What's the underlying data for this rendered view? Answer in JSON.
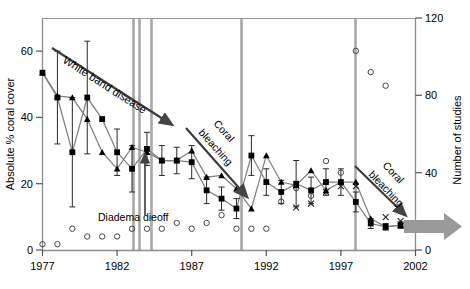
{
  "chart_data": {
    "type": "line",
    "title": "",
    "xlabel": "",
    "ylabel": "Absolute % coral cover",
    "ylabel_right": "Number of studies",
    "xlim": [
      1977,
      2002
    ],
    "ylim": [
      0,
      70
    ],
    "ylim_right": [
      0,
      120
    ],
    "xticks": [
      "1977",
      "1982",
      "1987",
      "1992",
      "1997",
      "2002"
    ],
    "xtick_values": [
      1977,
      1982,
      1987,
      1992,
      1997,
      2002
    ],
    "yticks_left": [
      "0",
      "20",
      "40",
      "60"
    ],
    "ytick_values_left": [
      0,
      20,
      40,
      60
    ],
    "yticks_right": [
      "0",
      "40",
      "80",
      "120"
    ],
    "ytick_values_right": [
      0,
      40,
      80,
      120
    ],
    "grid": false,
    "legend": "none",
    "series": [
      {
        "name": "mean-coral-cover-square",
        "marker": "filled-square",
        "x": [
          1977,
          1978,
          1979,
          1980,
          1981,
          1982,
          1983,
          1984,
          1985,
          1986,
          1987,
          1988,
          1989,
          1990,
          1991,
          1992,
          1993,
          1994,
          1995,
          1996,
          1997,
          1998,
          1999,
          2000,
          2001
        ],
        "values": [
          53.5,
          46.0,
          29.5,
          46.0,
          39.5,
          29.5,
          24.5,
          30.5,
          27.0,
          27.0,
          26.5,
          18.0,
          15.5,
          12.5,
          28.5,
          20.5,
          17.5,
          20.0,
          18.0,
          20.5,
          20.5,
          14.5,
          8.0,
          7.0,
          7.5
        ],
        "errors": [
          null,
          14.0,
          16.5,
          17.0,
          null,
          7.0,
          7.0,
          5.0,
          4.5,
          4.0,
          5.0,
          4.0,
          3.5,
          3.0,
          6.0,
          4.0,
          3.5,
          7.0,
          4.0,
          4.0,
          4.0,
          3.0,
          1.5,
          1.0,
          1.0
        ]
      },
      {
        "name": "median-coral-cover-triangle",
        "marker": "filled-triangle",
        "x": [
          1977,
          1978,
          1979,
          1980,
          1981,
          1982,
          1983,
          1984,
          1985,
          1986,
          1987,
          1988,
          1989,
          1990,
          1991,
          1992,
          1993,
          1994,
          1995,
          1996,
          1997,
          1998,
          1999,
          2000,
          2001
        ],
        "values": [
          53.5,
          46.5,
          46.0,
          39.5,
          29.5,
          24.5,
          31.0,
          29.5,
          27.0,
          27.0,
          30.0,
          22.0,
          22.5,
          18.5,
          12.5,
          28.5,
          20.5,
          19.5,
          24.0,
          18.0,
          20.5,
          20.5,
          9.5,
          7.0,
          7.5
        ]
      },
      {
        "name": "number-of-studies-open-circle",
        "marker": "open-circle",
        "x": [
          1977,
          1978,
          1979,
          1980,
          1981,
          1982,
          1983,
          1984,
          1985,
          1986,
          1987,
          1988,
          1989,
          1990,
          1991,
          1992,
          1993,
          1994,
          1995,
          1996,
          1997,
          1998,
          1999,
          2000
        ],
        "values": [
          3,
          3,
          11,
          7,
          7,
          7,
          11,
          11,
          11,
          14,
          11,
          14,
          18,
          11,
          11,
          11,
          25,
          32,
          28,
          46,
          40,
          103,
          92,
          85
        ]
      },
      {
        "name": "secondary-studies-cross",
        "marker": "cross",
        "x": [
          1994,
          1995,
          1996,
          1997,
          1998,
          2000,
          2001
        ],
        "values": [
          22,
          24,
          30,
          33,
          33,
          17,
          15
        ]
      }
    ],
    "event_lines": [
      {
        "label": "hurricane-allen",
        "year": 1983.0
      },
      {
        "label": "diadema-dieoff-line",
        "year": 1983.4
      },
      {
        "label": "diadema-dieoff-marker",
        "year": 1984.2
      },
      {
        "label": "bleaching-1990",
        "year": 1990.3
      },
      {
        "label": "bleaching-1998",
        "year": 1997.8
      }
    ],
    "annotations": [
      {
        "name": "white-band-disease",
        "text": "White band disease"
      },
      {
        "name": "diadema-dieoff",
        "text": "Diadema dieoff"
      },
      {
        "name": "coral-bleaching-1",
        "text": "Coral"
      },
      {
        "name": "coral-bleaching-1b",
        "text": "bleaching"
      },
      {
        "name": "coral-bleaching-2",
        "text": "Coral"
      },
      {
        "name": "coral-bleaching-2b",
        "text": "bleaching"
      }
    ],
    "colors": {
      "event_line": "#a0a0a0",
      "series_line": "#808080",
      "marker": "#000000",
      "arrow": "#808080",
      "axis": "#808080",
      "trend_arrow": "#555555"
    }
  }
}
